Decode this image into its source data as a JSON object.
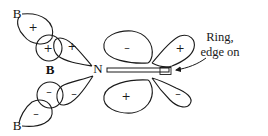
{
  "diagram": {
    "atoms": {
      "boron_top": "B",
      "boron_center": "B",
      "boron_bottom": "B",
      "nitrogen": "N"
    },
    "signs": {
      "upper_outer_lobe": "+",
      "upper_circle": "+",
      "upper_n_lobe": "+",
      "lower_circle": "–",
      "lower_n_lobe": "–",
      "lower_outer_lobe": "–",
      "middle_top_lobe": "–",
      "middle_bottom_lobe": "+",
      "ring_top_lobe": "+",
      "ring_bottom_lobe": "–"
    },
    "label": {
      "line1": "Ring,",
      "line2": "edge on"
    }
  }
}
